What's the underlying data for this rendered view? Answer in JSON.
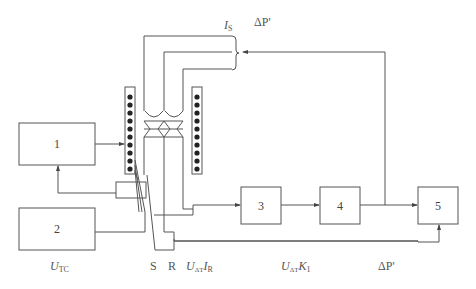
{
  "diagram": {
    "blocks": [
      {
        "id": "1",
        "label": "1"
      },
      {
        "id": "2",
        "label": "2"
      },
      {
        "id": "3",
        "label": "3"
      },
      {
        "id": "4",
        "label": "4"
      },
      {
        "id": "5",
        "label": "5"
      }
    ],
    "labels": {
      "top_is_main": "I",
      "top_is_sub": "S",
      "top_dp": "ΔP'",
      "utc_main": "U",
      "utc_sub": "TC",
      "s": "S",
      "r": "R",
      "uir_u": "U",
      "uir_u_sub": "ΔT",
      "uir_i": "I",
      "uir_i_sub": "R",
      "uk_u": "U",
      "uk_u_sub": "ΔT",
      "uk_k": "K",
      "uk_k_sub": "1",
      "bottom_dp": "ΔP'"
    },
    "colors": {
      "line": "#555555",
      "dot": "#222222"
    }
  }
}
